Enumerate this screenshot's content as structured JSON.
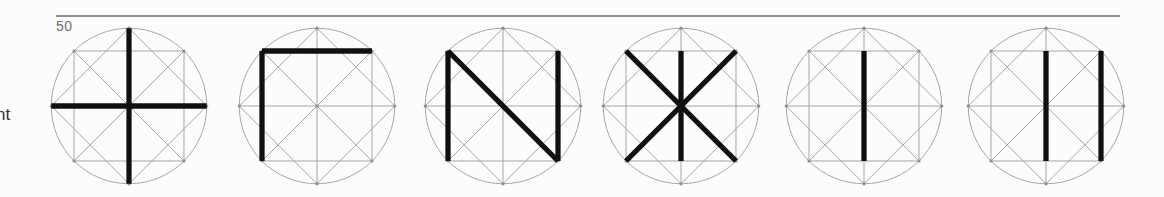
{
  "page": {
    "background": "#fcfcfc",
    "page_number": "50",
    "margin_text_fragment": "nt",
    "rule_color": "#8f8f8f",
    "page_number_color": "#6f6f6f",
    "margin_text_color": "#333333"
  },
  "figures": {
    "grid_color": "#9c9c9c",
    "bold_color": "#101010",
    "dot_color": "#8f8f8f",
    "geometry": {
      "viewbox": 200,
      "center": [
        100,
        100
      ],
      "radius": 96,
      "points": {
        "N": [
          100,
          4
        ],
        "E": [
          196,
          100
        ],
        "S": [
          100,
          196
        ],
        "W": [
          4,
          100
        ],
        "NW": [
          32.1,
          32.1
        ],
        "NE": [
          167.9,
          32.1
        ],
        "SE": [
          167.9,
          167.9
        ],
        "SW": [
          32.1,
          167.9
        ],
        "TM": [
          100,
          32.1
        ],
        "BM": [
          100,
          167.9
        ],
        "C": [
          100,
          100
        ]
      },
      "grid_segments": [
        [
          "NW",
          "NE"
        ],
        [
          "NE",
          "SE"
        ],
        [
          "SE",
          "SW"
        ],
        [
          "SW",
          "NW"
        ],
        [
          "N",
          "E"
        ],
        [
          "E",
          "S"
        ],
        [
          "S",
          "W"
        ],
        [
          "W",
          "N"
        ],
        [
          "NW",
          "SE"
        ],
        [
          "NE",
          "SW"
        ],
        [
          "N",
          "S"
        ],
        [
          "W",
          "E"
        ]
      ],
      "dot_points": [
        "N",
        "E",
        "S",
        "W",
        "NW",
        "NE",
        "SE",
        "SW",
        "C"
      ]
    },
    "layout": {
      "centers_x": [
        129,
        317,
        503,
        681,
        864,
        1046
      ],
      "center_y": 106,
      "box_size": 162
    },
    "items": [
      {
        "name": "cross",
        "bold_segments": [
          [
            "N",
            "S"
          ],
          [
            "W",
            "E"
          ]
        ]
      },
      {
        "name": "corner",
        "bold_segments": [
          [
            "NW",
            "NE"
          ],
          [
            "NW",
            "SW"
          ]
        ]
      },
      {
        "name": "n-diagonal",
        "bold_segments": [
          [
            "NW",
            "SW"
          ],
          [
            "NW",
            "SE"
          ],
          [
            "NE",
            "SE"
          ]
        ]
      },
      {
        "name": "asterisk",
        "bold_segments": [
          [
            "NW",
            "SE"
          ],
          [
            "NE",
            "SW"
          ],
          [
            "TM",
            "BM"
          ]
        ]
      },
      {
        "name": "bar",
        "bold_segments": [
          [
            "TM",
            "BM"
          ]
        ]
      },
      {
        "name": "double-bar",
        "bold_segments": [
          [
            "TM",
            "BM"
          ],
          [
            "NE",
            "SE"
          ]
        ]
      }
    ]
  }
}
